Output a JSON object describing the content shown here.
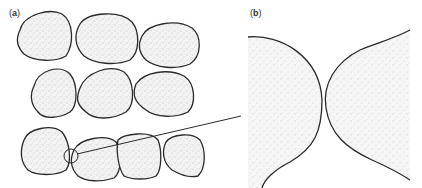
{
  "figure": {
    "panels": [
      {
        "id": "a",
        "label_open": "(",
        "label_letter": "a",
        "label_close": ")",
        "description": "Packed rounded grains with stippled interiors"
      },
      {
        "id": "b",
        "label_open": "(",
        "label_letter": "b",
        "label_close": ")",
        "description": "Magnified contact between two grains"
      }
    ],
    "colors": {
      "outline": "#2a2a2a",
      "stipple": "#9a9a9a",
      "background": "#ffffff"
    }
  }
}
